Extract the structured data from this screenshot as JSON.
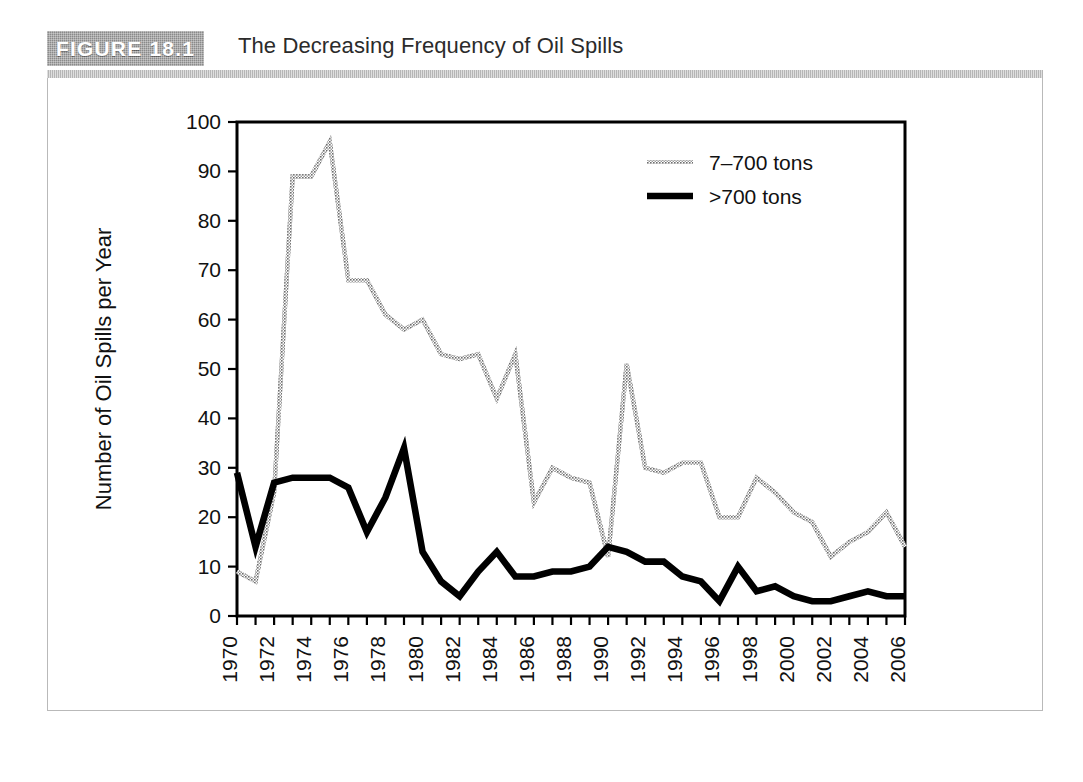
{
  "figure": {
    "label": "FIGURE 18.1",
    "title": "The Decreasing Frequency of Oil Spills",
    "label_bg_color": "#8a8a8a",
    "label_text_color": "#ffffff",
    "frame_color": "#b9b9b9"
  },
  "chart_data": {
    "type": "line",
    "title": "The Decreasing Frequency of Oil Spills",
    "xlabel": "Year",
    "ylabel": "Number of Oil Spills per Year",
    "xlim": [
      1970,
      2006
    ],
    "ylim": [
      0,
      100
    ],
    "ytick_step": 10,
    "xtick_step": 1,
    "xtick_label_step": 2,
    "grid": false,
    "legend_position": "top-right",
    "yticks": [
      0,
      10,
      20,
      30,
      40,
      50,
      60,
      70,
      80,
      90,
      100
    ],
    "x": [
      1970,
      1971,
      1972,
      1973,
      1974,
      1975,
      1976,
      1977,
      1978,
      1979,
      1980,
      1981,
      1982,
      1983,
      1984,
      1985,
      1986,
      1987,
      1988,
      1989,
      1990,
      1991,
      1992,
      1993,
      1994,
      1995,
      1996,
      1997,
      1998,
      1999,
      2000,
      2001,
      2002,
      2003,
      2004,
      2005,
      2006
    ],
    "xtick_labels": [
      "1970",
      "",
      "1972",
      "",
      "1974",
      "",
      "1976",
      "",
      "1978",
      "",
      "1980",
      "",
      "1982",
      "",
      "1984",
      "",
      "1986",
      "",
      "1988",
      "",
      "1990",
      "",
      "1992",
      "",
      "1994",
      "",
      "1996",
      "",
      "1998",
      "",
      "2000",
      "",
      "2002",
      "",
      "2004",
      "",
      "2006"
    ],
    "series": [
      {
        "name": "7–700 tons",
        "color": "#8c8c8c",
        "style": "thin-hatched",
        "values": [
          9,
          7,
          25,
          89,
          89,
          96,
          68,
          68,
          61,
          58,
          60,
          53,
          52,
          53,
          44,
          53,
          23,
          30,
          28,
          27,
          12,
          51,
          30,
          29,
          31,
          31,
          20,
          20,
          28,
          25,
          21,
          19,
          12,
          15,
          17,
          21,
          14
        ]
      },
      {
        "name": ">700 tons",
        "color": "#000000",
        "style": "thick-solid",
        "values": [
          29,
          14,
          27,
          28,
          28,
          28,
          26,
          17,
          24,
          34,
          13,
          7,
          4,
          9,
          13,
          8,
          8,
          9,
          9,
          10,
          14,
          13,
          11,
          11,
          8,
          7,
          3,
          10,
          5,
          6,
          4,
          3,
          3,
          4,
          5,
          4,
          4
        ]
      }
    ],
    "legend": [
      {
        "label": "7–700 tons",
        "color": "#8c8c8c",
        "style": "thin-hatched"
      },
      {
        "label": ">700 tons",
        "color": "#000000",
        "style": "thick-solid"
      }
    ]
  }
}
